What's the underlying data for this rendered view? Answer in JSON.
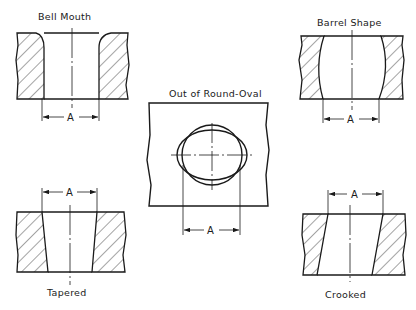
{
  "diagram": {
    "panels": [
      {
        "id": "bell-mouth",
        "label": "Bell Mouth",
        "dimension": "A"
      },
      {
        "id": "barrel-shape",
        "label": "Barrel Shape",
        "dimension": "A"
      },
      {
        "id": "out-of-round-oval",
        "label": "Out of Round-Oval",
        "dimension": "A"
      },
      {
        "id": "tapered",
        "label": "Tapered",
        "dimension": "A"
      },
      {
        "id": "crooked",
        "label": "Crooked",
        "dimension": "A"
      }
    ]
  },
  "colors": {
    "ink": "#1a1a1a",
    "background": "#ffffff"
  }
}
